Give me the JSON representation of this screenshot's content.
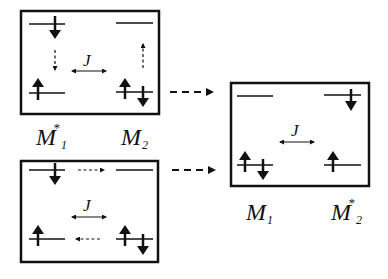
{
  "diagram": {
    "colors": {
      "stroke": "#111111",
      "background": "#ffffff"
    },
    "coupling_symbol": "J",
    "panels": [
      {
        "id": "top-left",
        "coupling": "J",
        "description": "M1* (left) excited, M2 (right); down-spin electron transfer and up-hole transfer (dashed vertical arrows)"
      },
      {
        "id": "bottom-left",
        "coupling": "J",
        "description": "Horizontal dashed arrows: upper level left to right, lower level right to left"
      },
      {
        "id": "right",
        "coupling": "J",
        "description": "Resulting state: M1 (left) ground, M2* (right) excited"
      }
    ],
    "labels": {
      "left_col1": {
        "main": "M",
        "sup": "*",
        "sub": "1"
      },
      "left_col2": {
        "main": "M",
        "sup": "",
        "sub": "2"
      },
      "right_col1": {
        "main": "M",
        "sup": "",
        "sub": "1"
      },
      "right_col2": {
        "main": "M",
        "sup": "*",
        "sub": "2"
      }
    },
    "connectors": [
      {
        "from": "top-left",
        "to": "right",
        "style": "dashed-arrow"
      },
      {
        "from": "bottom-left",
        "to": "right",
        "style": "dashed-arrow"
      }
    ]
  }
}
